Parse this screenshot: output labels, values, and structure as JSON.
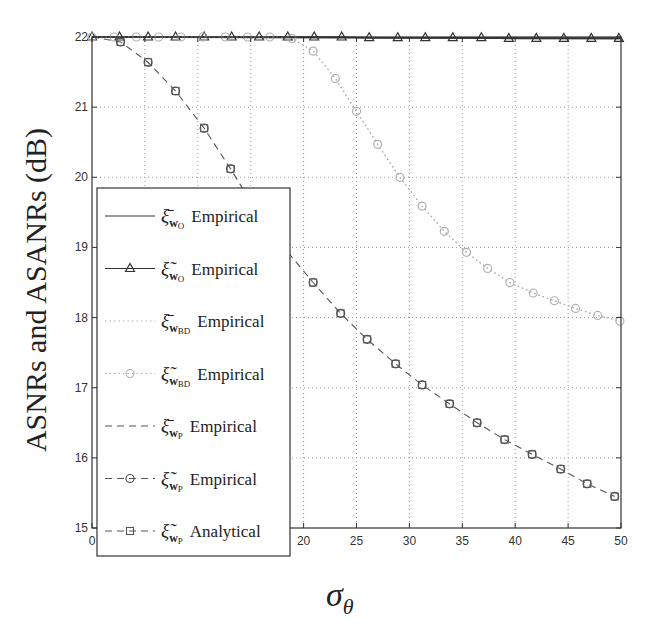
{
  "chart_data": {
    "type": "line",
    "title": "",
    "xlabel": "σ_θ",
    "ylabel": "ASNRs and ASANRs (dB)",
    "xlim": [
      0,
      50
    ],
    "ylim": [
      15,
      22
    ],
    "x_ticks": [
      "0",
      "5",
      "10",
      "15",
      "20",
      "25",
      "30",
      "35",
      "40",
      "45",
      "50"
    ],
    "y_ticks": [
      "15",
      "16",
      "17",
      "18",
      "19",
      "20",
      "21",
      "22"
    ],
    "grid": true,
    "legend_position": "lower-left inside",
    "legend": [
      "ξ̄_wO Empirical",
      "ξ̃_wO Empirical",
      "ξ̄_wBD Empirical",
      "ξ̃_wBD Empirical",
      "ξ̄_wP Empirical",
      "ξ̃_wP Empirical",
      "ξ̃_wP Analytical"
    ],
    "series": [
      {
        "name": "ξ̄_wO Empirical",
        "style": "solid",
        "marker": "none",
        "color": "#333333",
        "x": [
          0,
          50
        ],
        "y": [
          22.0,
          21.98
        ]
      },
      {
        "name": "ξ̃_wO Empirical",
        "style": "solid",
        "marker": "triangle",
        "color": "#333333",
        "x": [
          0,
          2.6,
          5.3,
          7.9,
          10.6,
          13.2,
          15.8,
          18.5,
          21.0,
          23.6,
          26.2,
          28.9,
          31.5,
          34.1,
          36.8,
          39.4,
          42.0,
          44.6,
          47.2,
          49.8
        ],
        "y": [
          22.0,
          22.0,
          22.0,
          22.0,
          22.0,
          22.0,
          22.0,
          22.0,
          22.0,
          22.0,
          21.99,
          21.99,
          21.99,
          21.99,
          21.99,
          21.98,
          21.98,
          21.98,
          21.98,
          21.98
        ]
      },
      {
        "name": "ξ̄_wBD Empirical",
        "style": "dotted",
        "marker": "none",
        "color": "#b0b0b0",
        "x": [
          0,
          2.1,
          4.2,
          6.3,
          8.4,
          10.5,
          12.6,
          14.7,
          16.8,
          18.9,
          20.9,
          23.0,
          25.0,
          27.0,
          29.1,
          31.2,
          33.3,
          35.4,
          37.4,
          39.5,
          41.7,
          43.7,
          45.7,
          47.8,
          49.9
        ],
        "y": [
          22.0,
          22.0,
          22.0,
          22.0,
          22.0,
          22.0,
          22.0,
          22.0,
          22.0,
          21.98,
          21.8,
          21.41,
          20.94,
          20.47,
          20.0,
          19.59,
          19.23,
          18.93,
          18.7,
          18.5,
          18.35,
          18.24,
          18.13,
          18.03,
          17.95
        ]
      },
      {
        "name": "ξ̃_wBD Empirical",
        "style": "dotted",
        "marker": "circle",
        "color": "#b0b0b0",
        "x": [
          0,
          2.1,
          4.2,
          6.3,
          8.4,
          10.5,
          12.6,
          14.7,
          16.8,
          18.9,
          20.9,
          23.0,
          25.0,
          27.0,
          29.1,
          31.2,
          33.3,
          35.4,
          37.4,
          39.5,
          41.7,
          43.7,
          45.7,
          47.8,
          49.9
        ],
        "y": [
          22.0,
          22.0,
          22.0,
          22.0,
          22.0,
          22.0,
          22.0,
          22.0,
          22.0,
          21.98,
          21.8,
          21.41,
          20.94,
          20.47,
          20.0,
          19.59,
          19.23,
          18.93,
          18.7,
          18.5,
          18.35,
          18.24,
          18.13,
          18.03,
          17.95
        ]
      },
      {
        "name": "ξ̄_wP Empirical",
        "style": "dashed",
        "marker": "none",
        "color": "#555555",
        "x": [
          0,
          2.7,
          5.3,
          7.9,
          10.6,
          13.1,
          15.7,
          18.3,
          20.9,
          23.5,
          26.0,
          28.7,
          31.2,
          33.8,
          36.4,
          39.0,
          41.6,
          44.3,
          46.8,
          49.4
        ],
        "y": [
          22.0,
          21.93,
          21.64,
          21.23,
          20.7,
          20.12,
          19.48,
          18.97,
          18.5,
          18.06,
          17.69,
          17.34,
          17.04,
          16.77,
          16.5,
          16.26,
          16.05,
          15.84,
          15.63,
          15.45
        ]
      },
      {
        "name": "ξ̃_wP Empirical",
        "style": "dashed",
        "marker": "circle",
        "color": "#555555",
        "x": [
          2.7,
          5.3,
          7.9,
          10.6,
          13.1,
          20.9,
          23.5,
          26.0,
          28.7,
          31.2,
          33.8,
          36.4,
          39.0,
          41.6,
          44.3,
          46.8,
          49.4
        ],
        "y": [
          21.93,
          21.64,
          21.23,
          20.7,
          20.12,
          18.5,
          18.06,
          17.69,
          17.34,
          17.04,
          16.77,
          16.5,
          16.26,
          16.05,
          15.84,
          15.63,
          15.45
        ]
      },
      {
        "name": "ξ̃_wP Analytical",
        "style": "dashed",
        "marker": "square",
        "color": "#555555",
        "x": [
          2.7,
          5.3,
          7.9,
          10.6,
          13.1,
          20.9,
          23.5,
          26.0,
          28.7,
          31.2,
          33.8,
          36.4,
          39.0,
          41.6,
          44.3,
          46.8,
          49.4
        ],
        "y": [
          21.93,
          21.64,
          21.23,
          20.7,
          20.12,
          18.5,
          18.06,
          17.69,
          17.34,
          17.04,
          16.77,
          16.5,
          16.26,
          16.05,
          15.84,
          15.63,
          15.45
        ]
      }
    ]
  },
  "axes": {
    "ylabel": "ASNRs and ASANRs (dB)",
    "xlabel_main": "σ",
    "xlabel_sub": "θ"
  },
  "legend_items": [
    {
      "sym": "ξ",
      "accent": "bar",
      "sub": "w",
      "subsub": "O",
      "text": "Empirical"
    },
    {
      "sym": "ξ",
      "accent": "tilde",
      "sub": "w",
      "subsub": "O",
      "text": "Empirical"
    },
    {
      "sym": "ξ",
      "accent": "bar",
      "sub": "w",
      "subsub": "BD",
      "text": "Empirical"
    },
    {
      "sym": "ξ",
      "accent": "tilde",
      "sub": "w",
      "subsub": "BD",
      "text": "Empirical"
    },
    {
      "sym": "ξ",
      "accent": "bar",
      "sub": "w",
      "subsub": "P",
      "text": "Empirical"
    },
    {
      "sym": "ξ",
      "accent": "tilde",
      "sub": "w",
      "subsub": "P",
      "text": "Empirical"
    },
    {
      "sym": "ξ",
      "accent": "tilde",
      "sub": "w",
      "subsub": "P",
      "text": "Analytical"
    }
  ],
  "colors": {
    "dark": "#333333",
    "mid": "#555555",
    "light": "#b0b0b0",
    "grid": "#999999"
  }
}
